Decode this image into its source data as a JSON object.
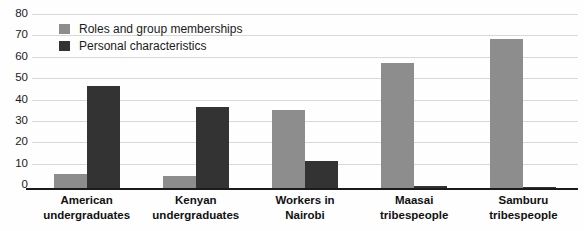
{
  "chart_data": {
    "type": "bar",
    "title": "",
    "subtitle": "",
    "xlabel": "",
    "ylabel": "",
    "ylim": [
      0,
      80
    ],
    "yticks": [
      0,
      10,
      20,
      30,
      40,
      50,
      60,
      70,
      80
    ],
    "grid": true,
    "legend_position": "top-left-inside",
    "categories": [
      "American undergraduates",
      "Kenyan undergraduates",
      "Workers in Nairobi",
      "Maasai tribespeople",
      "Samburu tribespeople"
    ],
    "category_lines": [
      [
        "American",
        "undergraduates"
      ],
      [
        "Kenyan",
        "undergraduates"
      ],
      [
        "Workers in",
        "Nairobi"
      ],
      [
        "Maasai",
        "tribespeople"
      ],
      [
        "Samburu",
        "tribespeople"
      ]
    ],
    "series": [
      {
        "name": "Roles and group memberships",
        "color": "#8d8d8d",
        "values": [
          7,
          6,
          37,
          59,
          70
        ]
      },
      {
        "name": "Personal characteristics",
        "color": "#333333",
        "values": [
          48,
          38.5,
          13,
          1.5,
          0.8
        ]
      }
    ]
  },
  "legend": {
    "items": [
      {
        "label": "Roles and group memberships",
        "swatch": "roles"
      },
      {
        "label": "Personal characteristics",
        "swatch": "personal"
      }
    ]
  },
  "axis": {
    "y_tick_labels": [
      "80",
      "70",
      "60",
      "50",
      "40",
      "30",
      "20",
      "10",
      "0"
    ]
  }
}
